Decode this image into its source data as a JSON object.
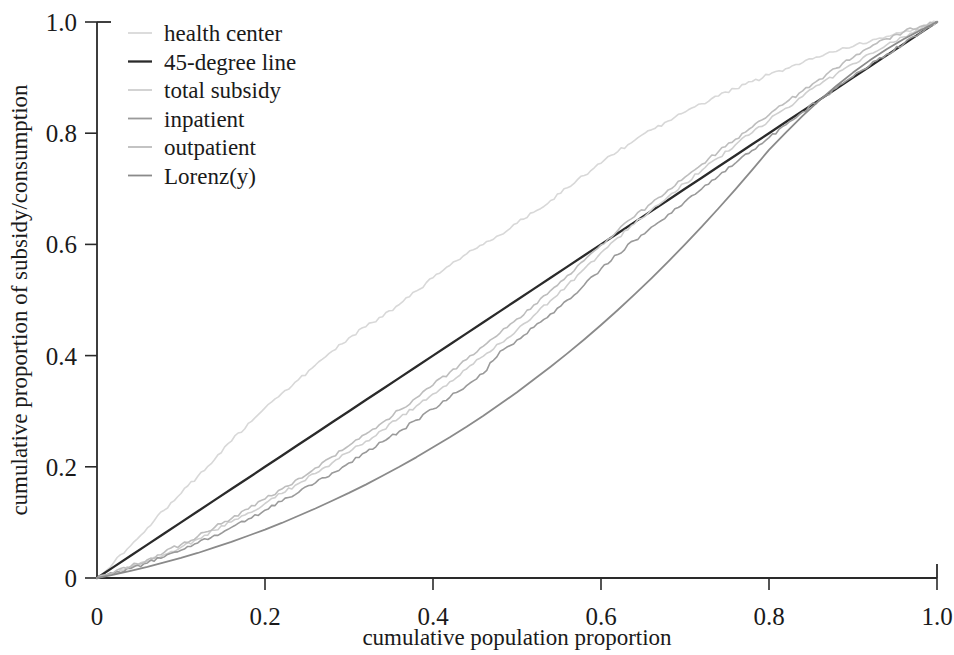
{
  "chart_data": {
    "type": "line",
    "title": "",
    "xlabel": "cumulative population proportion",
    "ylabel": "cumulative proportion of subsidy/consumption",
    "xlim": [
      0,
      1
    ],
    "ylim": [
      0,
      1
    ],
    "grid": false,
    "legend_position": "top-left",
    "xticks": [
      "0",
      "0.2",
      "0.4",
      "0.6",
      "0.8",
      "1.0"
    ],
    "xtick_values": [
      0,
      0.2,
      0.4,
      0.6,
      0.8,
      1.0
    ],
    "yticks": [
      "0",
      "0.2",
      "0.4",
      "0.6",
      "0.8",
      "1.0"
    ],
    "ytick_values": [
      0,
      0.2,
      0.4,
      0.6,
      0.8,
      1.0
    ],
    "x": [
      0,
      0.02,
      0.04,
      0.06,
      0.08,
      0.1,
      0.12,
      0.14,
      0.16,
      0.18,
      0.2,
      0.22,
      0.24,
      0.26,
      0.28,
      0.3,
      0.32,
      0.34,
      0.36,
      0.38,
      0.4,
      0.42,
      0.44,
      0.46,
      0.48,
      0.5,
      0.52,
      0.54,
      0.56,
      0.58,
      0.6,
      0.62,
      0.64,
      0.66,
      0.68,
      0.7,
      0.72,
      0.74,
      0.76,
      0.78,
      0.8,
      0.82,
      0.84,
      0.86,
      0.88,
      0.9,
      0.92,
      0.94,
      0.96,
      0.98,
      1.0
    ],
    "series": [
      {
        "name": "health center",
        "color": "#d8d8d8",
        "width": 1.6,
        "values": [
          0,
          0.028,
          0.058,
          0.09,
          0.122,
          0.152,
          0.183,
          0.213,
          0.246,
          0.278,
          0.306,
          0.332,
          0.357,
          0.383,
          0.408,
          0.432,
          0.452,
          0.47,
          0.492,
          0.516,
          0.54,
          0.562,
          0.583,
          0.6,
          0.617,
          0.638,
          0.658,
          0.679,
          0.702,
          0.724,
          0.746,
          0.767,
          0.787,
          0.806,
          0.822,
          0.838,
          0.853,
          0.867,
          0.88,
          0.893,
          0.905,
          0.916,
          0.927,
          0.937,
          0.947,
          0.956,
          0.965,
          0.974,
          0.982,
          0.991,
          1.0
        ]
      },
      {
        "name": "45-degree line",
        "color": "#2a2a2a",
        "width": 2.3,
        "values": [
          0,
          0.02,
          0.04,
          0.06,
          0.08,
          0.1,
          0.12,
          0.14,
          0.16,
          0.18,
          0.2,
          0.22,
          0.24,
          0.26,
          0.28,
          0.3,
          0.32,
          0.34,
          0.36,
          0.38,
          0.4,
          0.42,
          0.44,
          0.46,
          0.48,
          0.5,
          0.52,
          0.54,
          0.56,
          0.58,
          0.6,
          0.62,
          0.64,
          0.66,
          0.68,
          0.7,
          0.72,
          0.74,
          0.76,
          0.78,
          0.8,
          0.82,
          0.84,
          0.86,
          0.88,
          0.9,
          0.92,
          0.94,
          0.96,
          0.98,
          1.0
        ]
      },
      {
        "name": "total subsidy",
        "color": "#cfcfcf",
        "width": 1.6,
        "values": [
          0,
          0.009,
          0.019,
          0.03,
          0.042,
          0.055,
          0.07,
          0.086,
          0.101,
          0.117,
          0.134,
          0.152,
          0.17,
          0.188,
          0.207,
          0.226,
          0.246,
          0.266,
          0.288,
          0.309,
          0.331,
          0.353,
          0.376,
          0.399,
          0.422,
          0.446,
          0.472,
          0.499,
          0.527,
          0.556,
          0.585,
          0.612,
          0.637,
          0.662,
          0.686,
          0.71,
          0.733,
          0.756,
          0.779,
          0.801,
          0.823,
          0.845,
          0.866,
          0.887,
          0.906,
          0.925,
          0.943,
          0.959,
          0.973,
          0.987,
          1.0
        ]
      },
      {
        "name": "inpatient",
        "color": "#9a9a9a",
        "width": 1.6,
        "values": [
          0,
          0.008,
          0.017,
          0.027,
          0.038,
          0.05,
          0.063,
          0.077,
          0.091,
          0.106,
          0.122,
          0.138,
          0.154,
          0.171,
          0.189,
          0.207,
          0.226,
          0.245,
          0.264,
          0.284,
          0.304,
          0.325,
          0.346,
          0.368,
          0.408,
          0.428,
          0.451,
          0.475,
          0.5,
          0.527,
          0.556,
          0.582,
          0.607,
          0.631,
          0.654,
          0.677,
          0.7,
          0.723,
          0.746,
          0.769,
          0.792,
          0.815,
          0.838,
          0.86,
          0.881,
          0.902,
          0.922,
          0.942,
          0.96,
          0.98,
          1.0
        ]
      },
      {
        "name": "outpatient",
        "color": "#bdbdbd",
        "width": 1.6,
        "values": [
          0,
          0.01,
          0.021,
          0.033,
          0.046,
          0.06,
          0.075,
          0.091,
          0.107,
          0.124,
          0.142,
          0.16,
          0.179,
          0.198,
          0.218,
          0.238,
          0.259,
          0.28,
          0.302,
          0.324,
          0.347,
          0.37,
          0.393,
          0.417,
          0.441,
          0.466,
          0.491,
          0.517,
          0.544,
          0.571,
          0.599,
          0.625,
          0.65,
          0.674,
          0.698,
          0.721,
          0.744,
          0.767,
          0.789,
          0.811,
          0.833,
          0.855,
          0.876,
          0.897,
          0.917,
          0.936,
          0.954,
          0.97,
          0.982,
          0.992,
          1.0
        ]
      },
      {
        "name": "Lorenz(y)",
        "color": "#8a8a8a",
        "width": 1.8,
        "values": [
          0,
          0.006,
          0.013,
          0.02,
          0.028,
          0.036,
          0.045,
          0.055,
          0.065,
          0.076,
          0.087,
          0.099,
          0.112,
          0.125,
          0.139,
          0.153,
          0.168,
          0.184,
          0.2,
          0.217,
          0.235,
          0.253,
          0.272,
          0.292,
          0.313,
          0.334,
          0.357,
          0.38,
          0.404,
          0.429,
          0.455,
          0.482,
          0.51,
          0.539,
          0.569,
          0.6,
          0.632,
          0.665,
          0.699,
          0.734,
          0.77,
          0.801,
          0.831,
          0.859,
          0.885,
          0.909,
          0.931,
          0.951,
          0.969,
          0.985,
          1.0
        ]
      }
    ]
  },
  "legend": {
    "entries": [
      {
        "label": "health center"
      },
      {
        "label": "45-degree line"
      },
      {
        "label": "total subsidy"
      },
      {
        "label": "inpatient"
      },
      {
        "label": "outpatient"
      },
      {
        "label": "Lorenz(y)"
      }
    ]
  }
}
